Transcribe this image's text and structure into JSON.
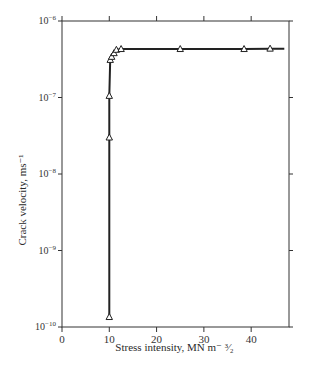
{
  "chart_data": {
    "type": "line",
    "title": "",
    "xlabel": "Stress intensity, MN m⁻³⁄₂",
    "ylabel": "Crack velocity, ms⁻¹",
    "xscale": "linear",
    "yscale": "log",
    "xlim": [
      0,
      48
    ],
    "ylim": [
      1e-10,
      1e-06
    ],
    "x_ticks": [
      0,
      10,
      20,
      30,
      40
    ],
    "x_tick_labels": [
      "0",
      "10",
      "20",
      "30",
      "40"
    ],
    "y_ticks": [
      1e-10,
      1e-09,
      1e-08,
      1e-07,
      1e-06
    ],
    "y_tick_labels": [
      "10⁻¹⁰",
      "10⁻⁹",
      "10⁻⁸",
      "10⁻⁷",
      "10⁻⁶"
    ],
    "grid": false,
    "legend": null,
    "marker": "open-triangle",
    "series": [
      {
        "name": "Crack velocity",
        "x": [
          10,
          10,
          10,
          10.2,
          10.5,
          11,
          11.5,
          12.5,
          25,
          38.5,
          44,
          47
        ],
        "y": [
          1.35e-10,
          3e-08,
          1.05e-07,
          3.1e-07,
          3.4e-07,
          3.8e-07,
          4.2e-07,
          4.3e-07,
          4.3e-07,
          4.3e-07,
          4.35e-07,
          4.35e-07
        ],
        "markers_shown": [
          true,
          true,
          true,
          true,
          true,
          true,
          true,
          true,
          true,
          true,
          true,
          false
        ]
      }
    ]
  },
  "labels": {
    "ylabel": "Crack velocity, ms⁻¹",
    "xlabel": "Stress intensity, MN m⁻ ³⁄₂"
  }
}
